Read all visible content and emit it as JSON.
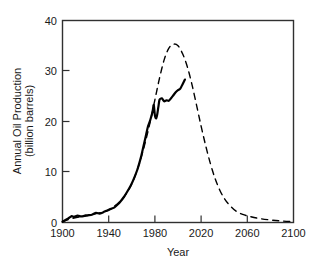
{
  "chart_data": {
    "type": "line",
    "title": "",
    "xlabel": "Year",
    "ylabel": "Annual Oil Production (billion barrels)",
    "ylabel_line1": "Annual Oil Production",
    "ylabel_line2": "(billion barrels)",
    "xlim": [
      1900,
      2100
    ],
    "ylim": [
      0,
      40
    ],
    "xticks": [
      1900,
      1940,
      1980,
      2020,
      2060,
      2100
    ],
    "xtick_labels": [
      "1900",
      "1940",
      "1980",
      "2020",
      "2060",
      "2100"
    ],
    "yticks": [
      0,
      10,
      20,
      30,
      40
    ],
    "ytick_labels": [
      "0",
      "10",
      "20",
      "30",
      "40"
    ],
    "grid": false,
    "legend": null,
    "frame": "box",
    "tick_direction": "in",
    "series": [
      {
        "name": "Historical annual oil production",
        "style": "solid",
        "color": "#000000",
        "width": 2.2,
        "x": [
          1900,
          1905,
          1908,
          1910,
          1913,
          1916,
          1918,
          1920,
          1923,
          1926,
          1929,
          1932,
          1935,
          1938,
          1940,
          1942,
          1945,
          1948,
          1950,
          1953,
          1956,
          1959,
          1962,
          1965,
          1968,
          1970,
          1972,
          1974,
          1976,
          1978,
          1979,
          1980,
          1981,
          1982,
          1983,
          1984,
          1986,
          1988,
          1990,
          1992,
          1994,
          1996,
          1998,
          2000,
          2002,
          2004,
          2006
        ],
        "y": [
          0.15,
          0.8,
          1.25,
          1.1,
          1.35,
          1.2,
          1.25,
          1.4,
          1.45,
          1.6,
          1.9,
          1.75,
          2.0,
          2.3,
          2.5,
          2.7,
          3.0,
          3.6,
          4.1,
          5.0,
          6.1,
          7.3,
          8.8,
          10.6,
          13.0,
          15.0,
          17.0,
          19.0,
          20.3,
          22.0,
          23.3,
          21.2,
          20.6,
          21.4,
          22.9,
          24.3,
          24.6,
          24.0,
          24.2,
          24.1,
          24.6,
          25.2,
          25.8,
          26.2,
          26.5,
          27.4,
          28.3
        ]
      },
      {
        "name": "Projected Hubbert peak curve",
        "style": "dashed",
        "color": "#000000",
        "width": 1.4,
        "dash": "6,5",
        "x": [
          1900,
          1910,
          1920,
          1930,
          1940,
          1950,
          1956,
          1962,
          1968,
          1972,
          1976,
          1980,
          1984,
          1988,
          1992,
          1996,
          2000,
          2004,
          2008,
          2012,
          2016,
          2020,
          2024,
          2028,
          2032,
          2036,
          2040,
          2044,
          2050,
          2056,
          2062,
          2070,
          2080,
          2090,
          2100
        ],
        "y": [
          0.2,
          0.9,
          1.3,
          1.8,
          2.5,
          4.2,
          6.0,
          8.7,
          12.8,
          16.2,
          20.0,
          24.3,
          28.6,
          32.2,
          34.5,
          35.3,
          35.0,
          33.4,
          30.9,
          27.4,
          23.3,
          19.1,
          15.2,
          11.7,
          8.8,
          6.5,
          4.8,
          3.6,
          2.3,
          1.6,
          1.2,
          0.8,
          0.5,
          0.3,
          0.2
        ]
      }
    ],
    "annotations": []
  },
  "axes": {
    "y_label_line1": "Annual Oil Production",
    "y_label_line2": "(billion barrels)",
    "x_label": "Year"
  }
}
